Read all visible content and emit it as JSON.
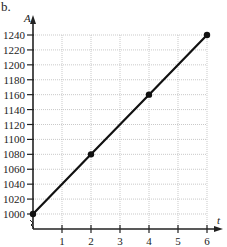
{
  "panel_label": "b.",
  "chart_data": {
    "type": "line",
    "title": "",
    "xlabel": "t",
    "ylabel": "A",
    "x": [
      0,
      2,
      4,
      6
    ],
    "series": [
      {
        "name": "A(t)",
        "values": [
          1000,
          1080,
          1160,
          1240
        ],
        "markers": true
      }
    ],
    "xlim": [
      0,
      6
    ],
    "ylim": [
      1000,
      1240
    ],
    "xticks": [
      1,
      2,
      3,
      4,
      5,
      6
    ],
    "xtick_labels": [
      "1",
      "2",
      "3",
      "4",
      "5",
      "6"
    ],
    "yticks": [
      1000,
      1020,
      1040,
      1060,
      1080,
      1100,
      1120,
      1140,
      1160,
      1180,
      1200,
      1220,
      1240
    ],
    "ytick_labels": [
      "1000",
      "1020",
      "1040",
      "1060",
      "1080",
      "1100",
      "1120",
      "1140",
      "1160",
      "1180",
      "1200",
      "1220",
      "1240"
    ],
    "grid": true,
    "line_color": "#111111",
    "grid_color": "#bbbbbb"
  }
}
